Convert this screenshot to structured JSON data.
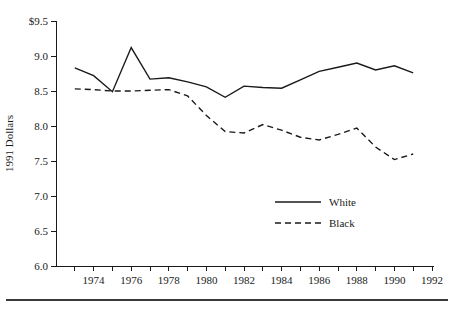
{
  "chart_data": {
    "type": "line",
    "title": "",
    "xlabel": "",
    "ylabel": "1991 Dollars",
    "xlim": [
      1972,
      1992
    ],
    "ylim": [
      6.0,
      9.5
    ],
    "grid": false,
    "legend_position": "center-right-inside",
    "x": [
      1973,
      1974,
      1975,
      1976,
      1977,
      1978,
      1979,
      1980,
      1981,
      1982,
      1983,
      1984,
      1985,
      1986,
      1987,
      1988,
      1989,
      1990,
      1991
    ],
    "y_ticks": [
      6.0,
      6.5,
      7.0,
      7.5,
      8.0,
      8.5,
      9.0,
      9.5
    ],
    "y_tick_labels": [
      "6.0",
      "6.5",
      "7.0",
      "7.5",
      "8.0",
      "8.5",
      "9.0",
      "$9.5"
    ],
    "x_ticks": [
      1973,
      1974,
      1975,
      1976,
      1977,
      1978,
      1979,
      1980,
      1981,
      1982,
      1983,
      1984,
      1985,
      1986,
      1987,
      1988,
      1989,
      1990,
      1991,
      1992
    ],
    "x_tick_labels": [
      "1974",
      "1976",
      "1978",
      "1980",
      "1982",
      "1984",
      "1986",
      "1988",
      "1990",
      "1992"
    ],
    "x_labeled_ticks": [
      1974,
      1976,
      1978,
      1980,
      1982,
      1984,
      1986,
      1988,
      1990,
      1992
    ],
    "series": [
      {
        "name": "White",
        "style": "solid",
        "color": "#1a1a1a",
        "values": [
          8.83,
          8.72,
          8.49,
          9.12,
          8.67,
          8.69,
          8.63,
          8.56,
          8.41,
          8.57,
          8.55,
          8.54,
          8.66,
          8.78,
          8.84,
          8.9,
          8.8,
          8.86,
          8.76
        ]
      },
      {
        "name": "Black",
        "style": "dashed",
        "color": "#1a1a1a",
        "values": [
          8.53,
          8.52,
          8.5,
          8.5,
          8.51,
          8.52,
          8.43,
          8.15,
          7.92,
          7.9,
          8.02,
          7.94,
          7.84,
          7.8,
          7.88,
          7.97,
          7.7,
          7.52,
          7.6
        ]
      }
    ]
  },
  "legend": {
    "entries": [
      {
        "label": "White",
        "style": "solid"
      },
      {
        "label": "Black",
        "style": "dashed"
      }
    ]
  }
}
